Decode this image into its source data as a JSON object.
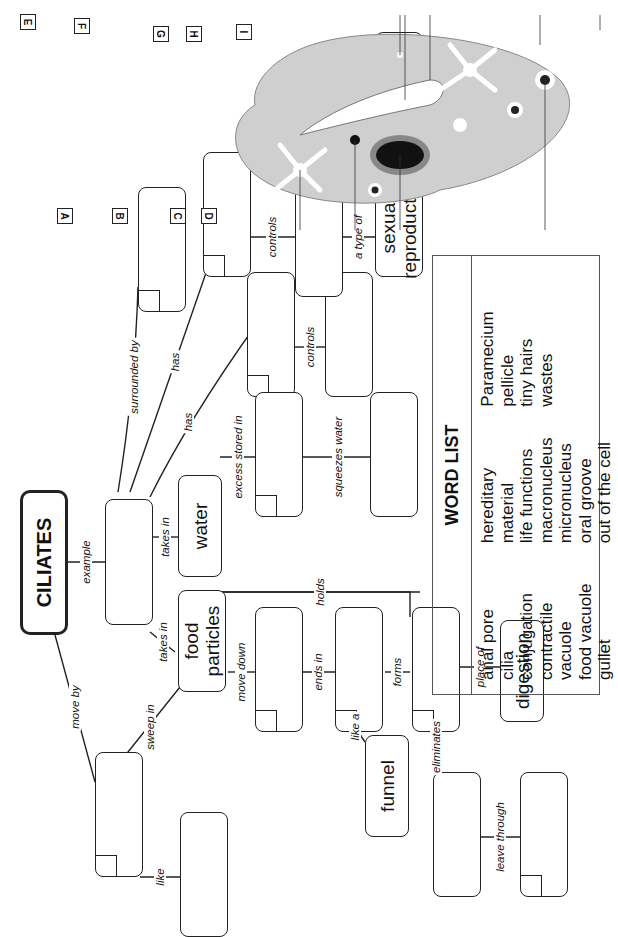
{
  "title_node": "CILIATES",
  "nodes": {
    "water": "water",
    "food_particles": "food particles",
    "funnel": "funnel",
    "digestion": "digestion",
    "sexual_reproduction": "sexual reproduction"
  },
  "links": {
    "example": "example",
    "move_by": "move by",
    "like": "like",
    "sweep_in": "sweep in",
    "takes_in_1": "takes in",
    "takes_in_2": "takes in",
    "has_1": "has",
    "has_2": "has",
    "surrounded_by": "surrounded  by",
    "controls_1": "controls",
    "controls_2": "controls",
    "a_type_of": "a type of",
    "exchange_of": "exchange of",
    "excess_stored_in": "excess stored in",
    "squeezes_water": "squeezes water",
    "holds": "holds",
    "move_down": "move down",
    "ends_in": "ends in",
    "like_a": "like a",
    "forms": "forms",
    "place_of": "place of",
    "eliminates": "eliminates",
    "leave_through": "leave through"
  },
  "word_list": {
    "header": "WORD LIST",
    "columns": [
      [
        "anal pore",
        "cilia",
        "conjugation",
        "contractile vacuole",
        "food vacuole",
        "gullet"
      ],
      [
        "hereditary material",
        "life functions",
        "macronucleus",
        "micronucleus",
        "oral groove",
        "out of the cell"
      ],
      [
        "Paramecium",
        "pellicle",
        "tiny hairs",
        "wastes"
      ]
    ]
  },
  "diagram_labels": [
    "A",
    "B",
    "C",
    "D",
    "E",
    "F",
    "G",
    "H",
    "I"
  ]
}
